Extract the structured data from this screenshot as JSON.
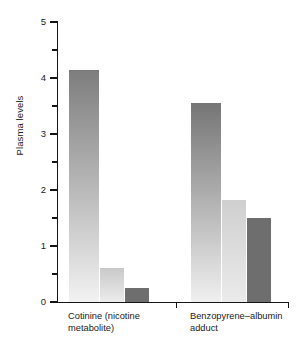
{
  "chart_data": {
    "type": "bar",
    "title": "",
    "xlabel": "",
    "ylabel": "Plasma levels",
    "ylim": [
      0,
      5
    ],
    "ytick_labels": [
      "0",
      "1",
      "2",
      "3",
      "4",
      "5"
    ],
    "ytick_values": [
      0,
      1,
      2,
      3,
      4,
      5
    ],
    "yminor_values": [
      0.5,
      1.5,
      2.5,
      3.5,
      4.5
    ],
    "grid": false,
    "legend": "none",
    "categories": [
      "Cotinine (nicotine metabolite)",
      "Benzopyrene–albumin adduct"
    ],
    "groups": [
      {
        "label_line1": "Cotinine (nicotine",
        "label_line2": "metabolite)",
        "bars": [
          {
            "value": 4.15,
            "style": "gradient-dark",
            "color_top": "#7d7d7d",
            "color_bottom": "#f2f2f2"
          },
          {
            "value": 0.6,
            "style": "gradient-light",
            "color_top": "#c9c9c9",
            "color_bottom": "#ececec"
          },
          {
            "value": 0.25,
            "style": "solid",
            "color_top": "#6e6e6e",
            "color_bottom": "#6e6e6e"
          }
        ]
      },
      {
        "label_line1": "Benzopyrene–albumin",
        "label_line2": "adduct",
        "bars": [
          {
            "value": 3.55,
            "style": "gradient-dark",
            "color_top": "#757575",
            "color_bottom": "#f0f0f0"
          },
          {
            "value": 1.82,
            "style": "gradient-light",
            "color_top": "#cfcfcf",
            "color_bottom": "#ebebeb"
          },
          {
            "value": 1.5,
            "style": "solid",
            "color_top": "#6e6e6e",
            "color_bottom": "#6e6e6e"
          }
        ]
      }
    ]
  },
  "axis": {
    "y_label": "Plasma levels",
    "ticks": [
      {
        "label": "5",
        "value": 5
      },
      {
        "label": "4",
        "value": 4
      },
      {
        "label": "3",
        "value": 3
      },
      {
        "label": "2",
        "value": 2
      },
      {
        "label": "1",
        "value": 1
      },
      {
        "label": "0",
        "value": 0
      }
    ]
  }
}
